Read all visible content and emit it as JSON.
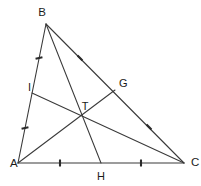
{
  "figure": {
    "type": "euclidean-geometry-diagram",
    "background_color": "#ffffff",
    "stroke_color": "#3a3a3a",
    "label_color": "#1a1a1a",
    "tick_color": "#2b2b2b",
    "canvas": {
      "width": 201,
      "height": 186
    }
  },
  "labels": {
    "A": "A",
    "B": "B",
    "C": "C",
    "G": "G",
    "H": "H",
    "I": "I",
    "T": "T"
  },
  "points": [
    {
      "id": "A",
      "label": "A",
      "role": "vertex",
      "x": 18,
      "y": 163,
      "label_x": 10,
      "label_y": 167
    },
    {
      "id": "B",
      "label": "B",
      "role": "vertex",
      "x": 46,
      "y": 24,
      "label_x": 42,
      "label_y": 16
    },
    {
      "id": "C",
      "label": "C",
      "role": "vertex",
      "x": 184,
      "y": 163,
      "label_x": 191,
      "label_y": 166
    },
    {
      "id": "G",
      "label": "G",
      "role": "midpoint",
      "x": 115,
      "y": 90,
      "label_x": 119,
      "label_y": 87
    },
    {
      "id": "H",
      "label": "H",
      "role": "midpoint",
      "x": 101,
      "y": 163,
      "label_x": 101,
      "label_y": 180
    },
    {
      "id": "I",
      "label": "I",
      "role": "midpoint",
      "x": 32,
      "y": 93,
      "label_x": 28,
      "label_y": 91
    },
    {
      "id": "T",
      "label": "T",
      "role": "centroid",
      "x": 85,
      "y": 117,
      "label_x": 85,
      "label_y": 110
    }
  ],
  "sides": [
    {
      "id": "AB",
      "from": "A",
      "to": "B",
      "midpoint": "I"
    },
    {
      "id": "BC",
      "from": "B",
      "to": "C",
      "midpoint": "G"
    },
    {
      "id": "AC",
      "from": "A",
      "to": "C",
      "midpoint": "H"
    }
  ],
  "medians": [
    {
      "id": "AG",
      "from": "A",
      "to": "G",
      "x1": 18,
      "y1": 163,
      "x2": 115,
      "y2": 90
    },
    {
      "id": "BH",
      "from": "B",
      "to": "H",
      "x1": 46,
      "y1": 24,
      "x2": 101,
      "y2": 163
    },
    {
      "id": "CI",
      "from": "C",
      "to": "I",
      "x1": 184,
      "y1": 163,
      "x2": 32,
      "y2": 93
    }
  ],
  "edges": [
    {
      "id": "AB",
      "x1": 18,
      "y1": 163,
      "x2": 46,
      "y2": 24
    },
    {
      "id": "BC",
      "x1": 46,
      "y1": 24,
      "x2": 184,
      "y2": 163
    },
    {
      "id": "AC",
      "x1": 18,
      "y1": 163,
      "x2": 184,
      "y2": 163
    }
  ],
  "tick_marks": [
    {
      "id": "tick-BI",
      "segment": "B-I",
      "cx": 39,
      "cy": 58,
      "angle_deg": -11,
      "length": 7
    },
    {
      "id": "tick-IA",
      "segment": "I-A",
      "cx": 25,
      "cy": 128,
      "angle_deg": -11,
      "length": 7
    },
    {
      "id": "tick-BG",
      "segment": "B-G",
      "cx": 80,
      "cy": 58,
      "angle_deg": 45,
      "length": 7
    },
    {
      "id": "tick-GC",
      "segment": "G-C",
      "cx": 149,
      "cy": 127,
      "angle_deg": 45,
      "length": 7
    },
    {
      "id": "tick-AH",
      "segment": "A-H",
      "cx": 60,
      "cy": 163,
      "angle_deg": 90,
      "length": 7
    },
    {
      "id": "tick-HC",
      "segment": "H-C",
      "cx": 141,
      "cy": 163,
      "angle_deg": 90,
      "length": 7
    }
  ]
}
